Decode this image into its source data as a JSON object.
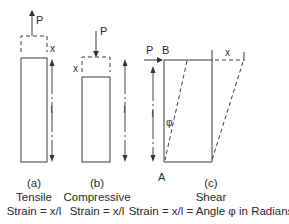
{
  "figure": {
    "panels": [
      {
        "id": "a",
        "label": "(a)",
        "title": "Tensile",
        "formula": "Strain = x/l",
        "force_label": "P",
        "extension_label": "x",
        "length_label": "l"
      },
      {
        "id": "b",
        "label": "(b)",
        "title": "Compressive",
        "formula": "Strain = x/l",
        "force_label": "P",
        "extension_label": "x",
        "length_label": "l"
      },
      {
        "id": "c",
        "label": "(c)",
        "title": "Shear",
        "formula": "Strain = x/l = Angle φ in Radians",
        "force_label": "P",
        "extension_label": "x",
        "length_label": "l",
        "corner_top": "B",
        "corner_bottom": "A",
        "angle_label": "φ"
      }
    ]
  },
  "colors": {
    "line": "#3a3a3a",
    "text": "#2a2a2a",
    "background": "#ffffff"
  }
}
